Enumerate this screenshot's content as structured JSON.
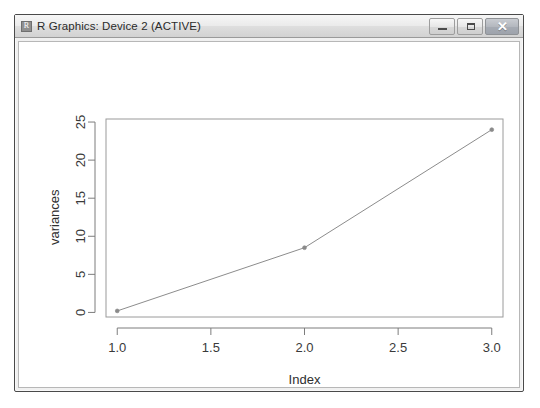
{
  "window": {
    "title": "R Graphics: Device 2 (ACTIVE)",
    "icon": "r-app-icon",
    "controls": {
      "minimize_label": "",
      "maximize_label": "",
      "close_label": "✕"
    }
  },
  "chart_data": {
    "type": "line",
    "title": "",
    "xlabel": "Index",
    "ylabel": "variances",
    "x": [
      1,
      2,
      3
    ],
    "values": [
      0.2,
      8.5,
      24.0
    ],
    "series": [
      {
        "name": "variances",
        "values": [
          0.2,
          8.5,
          24.0
        ]
      }
    ],
    "xlim": [
      0.94,
      3.06
    ],
    "ylim": [
      -0.6,
      25.4
    ],
    "xticks": [
      1.0,
      1.5,
      2.0,
      2.5,
      3.0
    ],
    "xticklabels": [
      "1.0",
      "1.5",
      "2.0",
      "2.5",
      "3.0"
    ],
    "yticks": [
      0,
      5,
      10,
      15,
      20,
      25
    ],
    "yticklabels": [
      "0",
      "5",
      "10",
      "15",
      "20",
      "25"
    ],
    "grid": false,
    "legend": null,
    "marker": "point",
    "line_color": "#8c8c8c",
    "marker_color": "#8a8a8a"
  }
}
